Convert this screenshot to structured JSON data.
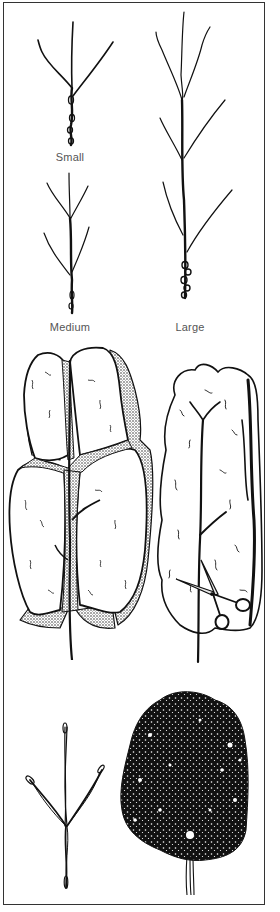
{
  "figure": {
    "colors": {
      "ink": "#111111",
      "border": "#333333",
      "label": "#555555",
      "background": "#ffffff"
    },
    "size_labels": {
      "small": "Small",
      "medium": "Medium",
      "large": "Large"
    },
    "panels": [
      {
        "id": "small-tree",
        "caption": "Small"
      },
      {
        "id": "large-tree",
        "caption": "Large"
      },
      {
        "id": "medium-tree",
        "caption": "Medium"
      },
      {
        "id": "shaped-pruned-tree",
        "caption": ""
      },
      {
        "id": "trimmed-tree-with-scissors",
        "caption": ""
      },
      {
        "id": "young-sapling",
        "caption": ""
      },
      {
        "id": "mature-dense-tree",
        "caption": ""
      }
    ],
    "icons": {
      "scissors": "scissors-icon"
    }
  }
}
